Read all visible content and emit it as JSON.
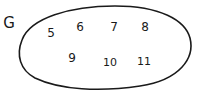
{
  "diagram": {
    "type": "set-diagram",
    "set": {
      "name": "G",
      "elements": [
        {
          "value": "5",
          "x": 51,
          "y": 33
        },
        {
          "value": "6",
          "x": 80,
          "y": 27
        },
        {
          "value": "7",
          "x": 114,
          "y": 27
        },
        {
          "value": "8",
          "x": 145,
          "y": 27
        },
        {
          "value": "9",
          "x": 72,
          "y": 58
        },
        {
          "value": "10",
          "x": 110,
          "y": 62
        },
        {
          "value": "11",
          "x": 144,
          "y": 61
        }
      ]
    },
    "colors": {
      "stroke": "#1a1a1a",
      "background": "#ffffff"
    }
  }
}
